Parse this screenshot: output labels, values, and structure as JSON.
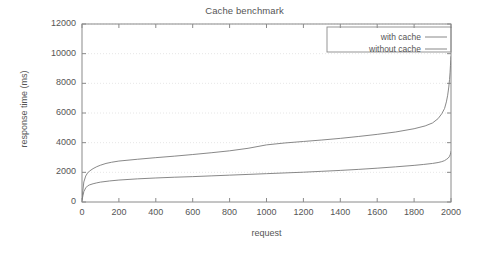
{
  "chart_data": {
    "type": "line",
    "title": "Cache benchmark",
    "xlabel": "request",
    "ylabel": "response time (ms)",
    "xlim": [
      0,
      2000
    ],
    "ylim": [
      0,
      12000
    ],
    "xticks": [
      0,
      200,
      400,
      600,
      800,
      1000,
      1200,
      1400,
      1600,
      1800,
      2000
    ],
    "yticks": [
      0,
      2000,
      4000,
      6000,
      8000,
      10000,
      12000
    ],
    "xtick_labels": [
      "0",
      "200",
      "400",
      "600",
      "800",
      "1000",
      "1200",
      "1400",
      "1600",
      "1800",
      "2000"
    ],
    "ytick_labels": [
      "0",
      "2000",
      "4000",
      "6000",
      "8000",
      "10000",
      "12000"
    ],
    "grid": true,
    "grid_style": "dotted-horizontal",
    "legend_position": "top-right",
    "legend_border": true,
    "series": [
      {
        "name": "with cache",
        "color": "#7a7a7a",
        "x": [
          0,
          5,
          10,
          20,
          30,
          40,
          60,
          80,
          100,
          150,
          200,
          300,
          400,
          500,
          600,
          700,
          800,
          900,
          1000,
          1100,
          1200,
          1300,
          1400,
          1500,
          1600,
          1700,
          1800,
          1850,
          1900,
          1930,
          1950,
          1965,
          1975,
          1985,
          1992,
          1996,
          1999,
          2000
        ],
        "y": [
          120,
          420,
          700,
          950,
          1080,
          1150,
          1230,
          1290,
          1340,
          1420,
          1480,
          1560,
          1620,
          1670,
          1710,
          1760,
          1810,
          1860,
          1910,
          1960,
          2010,
          2070,
          2130,
          2200,
          2280,
          2370,
          2470,
          2530,
          2600,
          2660,
          2720,
          2790,
          2870,
          2960,
          3080,
          3200,
          3330,
          3400
        ]
      },
      {
        "name": "without cache",
        "color": "#7a7a7a",
        "x": [
          0,
          5,
          10,
          20,
          30,
          40,
          60,
          80,
          100,
          130,
          160,
          200,
          300,
          400,
          500,
          600,
          700,
          800,
          900,
          1000,
          1100,
          1200,
          1300,
          1400,
          1500,
          1600,
          1700,
          1800,
          1860,
          1900,
          1930,
          1950,
          1965,
          1975,
          1982,
          1988,
          1992,
          1995,
          1997,
          1999,
          2000
        ],
        "y": [
          200,
          800,
          1350,
          1750,
          1950,
          2080,
          2250,
          2380,
          2480,
          2600,
          2680,
          2760,
          2880,
          2990,
          3090,
          3200,
          3320,
          3450,
          3620,
          3850,
          3980,
          4080,
          4180,
          4290,
          4420,
          4560,
          4720,
          4940,
          5130,
          5330,
          5620,
          5950,
          6300,
          6750,
          7200,
          7750,
          8250,
          8750,
          9200,
          9600,
          9800
        ]
      }
    ]
  },
  "plot": {
    "left": 82,
    "top": 24,
    "right": 451,
    "bottom": 202,
    "axis_color": "#8a8a8a",
    "grid_color": "#e0e0e0",
    "background": "#ffffff"
  },
  "legend": {
    "items": [
      {
        "label": "with cache"
      },
      {
        "label": "without cache"
      }
    ]
  }
}
